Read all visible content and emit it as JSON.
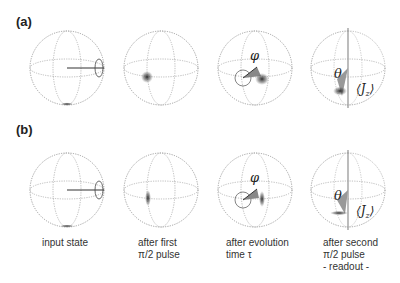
{
  "panels": [
    {
      "label": "(a)"
    },
    {
      "label": "(b)"
    }
  ],
  "captions": [
    {
      "line1": "input state",
      "line2": "",
      "line3": ""
    },
    {
      "line1": "after first",
      "line2": "π/2 pulse",
      "line3": ""
    },
    {
      "line1": "after evolution",
      "line2": "time τ",
      "line3": ""
    },
    {
      "line1": "after second",
      "line2": "π/2 pulse",
      "line3": "- readout -"
    }
  ],
  "symbols": {
    "phi": "φ",
    "theta": "θ",
    "jz": "⟨J",
    "jz_sub": "z",
    "jz_close": "⟩"
  },
  "colors": {
    "sphere_line": "#8a8a8a",
    "vector": "#333333",
    "cone": "#9a9a9a",
    "blob": "#2a2a2a"
  }
}
